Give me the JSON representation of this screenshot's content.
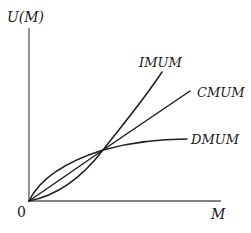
{
  "diagram": {
    "axes": {
      "y_label": "U(M)",
      "x_label": "M",
      "origin_label": "0"
    },
    "curves": [
      {
        "id": "imum",
        "label": "IMUM",
        "shape": "convex (increasing marginal utility of money)"
      },
      {
        "id": "cmum",
        "label": "CMUM",
        "shape": "linear (constant marginal utility of money)"
      },
      {
        "id": "dmum",
        "label": "DMUM",
        "shape": "concave (diminishing marginal utility of money)"
      }
    ],
    "intersection": "all three curves start at origin and cross at a common point",
    "colors": {
      "curve": "#1e1e1e",
      "axis": "#5a5a5a",
      "background": "#ffffff"
    }
  }
}
